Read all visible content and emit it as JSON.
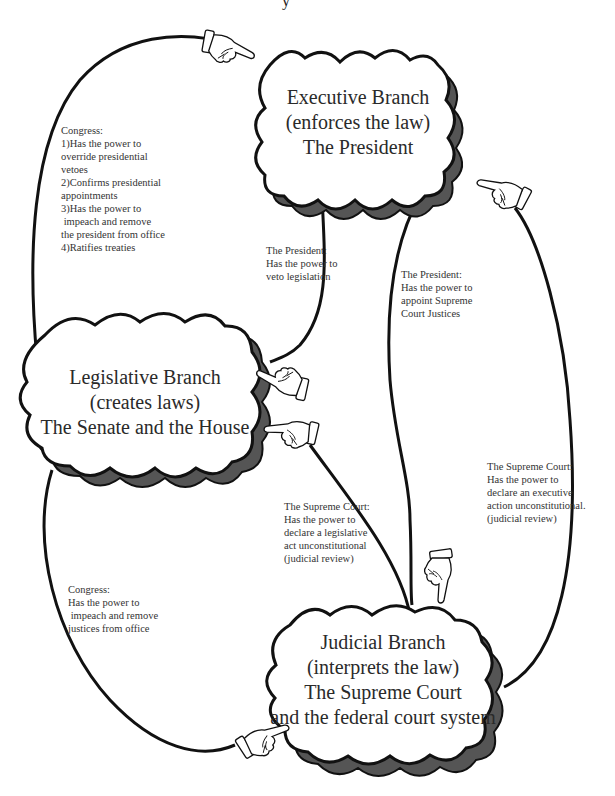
{
  "title_fragment": "y",
  "colors": {
    "line": "#111111",
    "shadow": "#555555",
    "cloud_fill": "#ffffff",
    "hand_fill": "#ffffff",
    "text": "#2a2a2a"
  },
  "branches": {
    "executive": {
      "name": "Executive Branch",
      "role": "(enforces the law)",
      "members": "The President"
    },
    "legislative": {
      "name": "Legislative Branch",
      "role": "(creates laws)",
      "members": "The Senate and the House"
    },
    "judicial": {
      "name": "Judicial Branch",
      "role": "(interprets the law)",
      "members": "The Supreme Court",
      "members2": "and the federal court system"
    }
  },
  "notes": {
    "congress_over_president": {
      "lines": [
        "Congress:",
        "1)Has the power to",
        "override presidential",
        "vetoes",
        "2)Confirms presidential",
        "appointments",
        "3)Has the power to",
        " impeach and remove",
        "the president from office",
        "4)Ratifies treaties"
      ]
    },
    "president_veto": {
      "lines": [
        "The President:",
        "Has the power to",
        "veto legislation"
      ]
    },
    "president_appoint": {
      "lines": [
        "The President:",
        "Has the power to",
        "appoint Supreme",
        "Court Justices"
      ]
    },
    "court_legislative_review": {
      "lines": [
        "The Supreme Court:",
        "Has the power to",
        "declare a legislative",
        "act unconstitutional",
        "(judicial review)"
      ]
    },
    "court_executive_review": {
      "lines": [
        "The Supreme Court:",
        "Has the power to",
        "declare an executive",
        "action unconstitutional.",
        "(judicial review)"
      ]
    },
    "congress_over_justices": {
      "lines": [
        "Congress:",
        "Has the power to",
        " impeach and remove",
        "justices from office"
      ]
    }
  },
  "arrows": [
    {
      "from": "legislative",
      "to": "executive",
      "icon": "pointing-hand-right"
    },
    {
      "from": "executive",
      "to": "legislative",
      "icon": "pointing-hand-left"
    },
    {
      "from": "judicial",
      "to": "legislative",
      "icon": "pointing-hand-left"
    },
    {
      "from": "executive",
      "to": "judicial",
      "icon": "pointing-hand-down"
    },
    {
      "from": "judicial",
      "to": "executive",
      "icon": "pointing-hand-left"
    },
    {
      "from": "legislative",
      "to": "judicial",
      "icon": "pointing-hand-right"
    }
  ]
}
